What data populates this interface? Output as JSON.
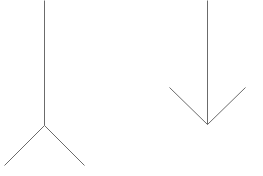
{
  "diagram": {
    "type": "muller-lyer-illusion",
    "stroke_color": "#6b6b6b",
    "background": "#ffffff",
    "figures": [
      {
        "name": "left-figure-fins-out",
        "shaft": {
          "x1": 44,
          "y1": 0,
          "x2": 44,
          "y2": 125
        },
        "fins": [
          {
            "x1": 44,
            "y1": 125,
            "x2": 4,
            "y2": 165
          },
          {
            "x1": 44,
            "y1": 125,
            "x2": 84,
            "y2": 165
          }
        ]
      },
      {
        "name": "right-figure-arrowhead",
        "shaft": {
          "x1": 207,
          "y1": 0,
          "x2": 207,
          "y2": 124
        },
        "fins": [
          {
            "x1": 169,
            "y1": 87,
            "x2": 207,
            "y2": 124
          },
          {
            "x1": 245,
            "y1": 87,
            "x2": 207,
            "y2": 124
          }
        ]
      }
    ]
  }
}
